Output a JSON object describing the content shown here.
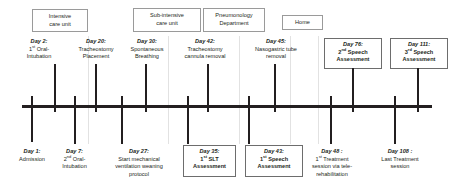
{
  "diagram": {
    "axis": {
      "orientation": "horizontal"
    },
    "care_settings": [
      {
        "id": "intensive-care-unit",
        "line1": "Intensive",
        "line2": "care unit"
      },
      {
        "id": "sub-intensive-care-unit",
        "line1": "Sub-intensive",
        "line2": "care unit"
      },
      {
        "id": "pneumonology-department",
        "line1": "Pneumonology",
        "line2": "Department"
      },
      {
        "id": "home",
        "line1": "Home",
        "line2": ""
      }
    ],
    "events_above": [
      {
        "id": "day-2-oral-intubation",
        "day": "Day 2:",
        "line1": "1",
        "sup1": "st",
        "line1b": " Oral-",
        "line2": "Intubation",
        "line3": "",
        "boxed": false
      },
      {
        "id": "day-20-tracheostomy-placement",
        "day": "Day 20:",
        "line1": "Tracheostomy",
        "line2": "Placement",
        "line3": "",
        "boxed": false
      },
      {
        "id": "day-30-spontaneous-breathing",
        "day": "Day 30:",
        "line1": "Spontaneous",
        "line2": "Breathing",
        "line3": "",
        "boxed": false
      },
      {
        "id": "day-42-tracheostomy-cannula-removal",
        "day": "Day 42:",
        "line1": "Tracheostomy",
        "line2": "cannula removal",
        "line3": "",
        "boxed": false
      },
      {
        "id": "day-45-nasogastric-tube-removal",
        "day": "Day 45:",
        "line1": "Nasogastric tube",
        "line2": "removal",
        "line3": "",
        "boxed": false
      },
      {
        "id": "day-76-second-speech-assessment",
        "day": "Day 76:",
        "line1": "2",
        "sup1": "nd",
        "line1b": " Speech",
        "line2": "Assessment",
        "line3": "",
        "boxed": true
      },
      {
        "id": "day-111-third-speech-assessment",
        "day": "Day 111:",
        "line1": "3",
        "sup1": "rd",
        "line1b": " Speech",
        "line2": "Assessment",
        "line3": "",
        "boxed": true
      }
    ],
    "events_below": [
      {
        "id": "day-1-admission",
        "day": "Day 1:",
        "line1": "Admission",
        "line2": "",
        "line3": "",
        "boxed": false
      },
      {
        "id": "day-7-second-oral-intubation",
        "day": "Day 7:",
        "line1": "2",
        "sup1": "nd",
        "line1b": " Oral-",
        "line2": "Intubation",
        "line3": "",
        "boxed": false
      },
      {
        "id": "day-27-start-mechanical-ventilation-weaning",
        "day": "Day 27:",
        "line1": "Start mechanical",
        "line2": "ventilation weaning",
        "line3": "protocol",
        "boxed": false
      },
      {
        "id": "day-35-first-slt-assessment",
        "day": "Day 35:",
        "line1": "1",
        "sup1": "st",
        "line1b": " SLT",
        "line2": "Assessment",
        "line3": "",
        "boxed": true
      },
      {
        "id": "day-43-first-speech-assessment",
        "day": "Day 43:",
        "line1": "1",
        "sup1": "st",
        "line1b": " Speech",
        "line2": "Assessment",
        "line3": "",
        "boxed": true
      },
      {
        "id": "day-48-first-treatment-session-telerehabilitation",
        "day": "Day 48 :",
        "line1": "1",
        "sup1": "st",
        "line1b": " Treatment",
        "line2": "session via tele-",
        "line3": "rehabilitation",
        "boxed": false
      },
      {
        "id": "day-108-last-treatment-session",
        "day": "Day 108 :",
        "line1": "Last Treatment",
        "line2": "session",
        "line3": "",
        "boxed": false
      }
    ]
  },
  "colors": {
    "ink": "#231f20",
    "box_border": "#9a9a9a",
    "boxed_event_border": "#6d6d6d",
    "background": "#ffffff"
  }
}
